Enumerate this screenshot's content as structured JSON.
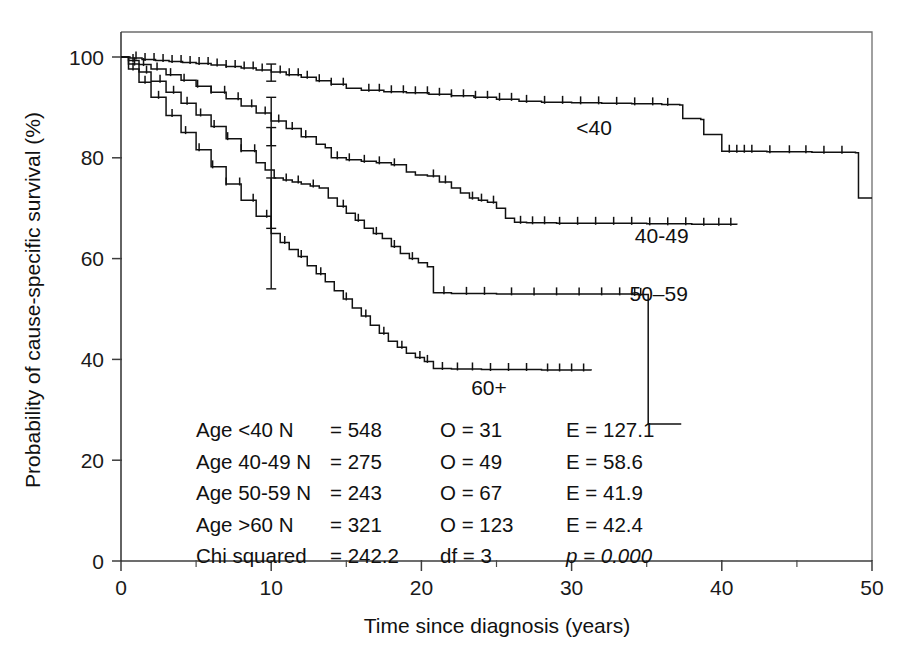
{
  "chart_data": {
    "type": "line",
    "title": "",
    "xlabel": "Time since diagnosis (years)",
    "ylabel": "Probability of cause-specific survival (%)",
    "xlim": [
      0,
      50
    ],
    "ylim": [
      0,
      100
    ],
    "xticks": [
      "0",
      "10",
      "20",
      "30",
      "40",
      "50"
    ],
    "xtick_values": [
      0,
      10,
      20,
      30,
      40,
      50
    ],
    "xminor_values": [
      5,
      15,
      25,
      35,
      45
    ],
    "yticks": [
      "0",
      "20",
      "40",
      "60",
      "80",
      "100"
    ],
    "ytick_values": [
      0,
      20,
      40,
      60,
      80,
      100
    ],
    "grid": false,
    "legend_position": "inline-curve-labels",
    "series": [
      {
        "name": "<40",
        "label": "<40",
        "label_x": 31.5,
        "label_y": 84.5,
        "points": [
          [
            0,
            100
          ],
          [
            0.6,
            99.8
          ],
          [
            1.4,
            99.5
          ],
          [
            2.3,
            99.3
          ],
          [
            3.2,
            99.1
          ],
          [
            4.1,
            98.9
          ],
          [
            5.0,
            98.7
          ],
          [
            6.0,
            98.4
          ],
          [
            7.0,
            98.1
          ],
          [
            8.0,
            97.8
          ],
          [
            9.0,
            97.4
          ],
          [
            10.0,
            97.0
          ],
          [
            11.0,
            96.5
          ],
          [
            12.0,
            96.0
          ],
          [
            13.0,
            95.3
          ],
          [
            14.0,
            94.6
          ],
          [
            15.0,
            93.8
          ],
          [
            16.0,
            93.4
          ],
          [
            17.5,
            93.1
          ],
          [
            19.0,
            92.9
          ],
          [
            20.5,
            92.6
          ],
          [
            22.0,
            92.3
          ],
          [
            23.5,
            92.0
          ],
          [
            25.0,
            91.6
          ],
          [
            26.5,
            91.2
          ],
          [
            28.0,
            91.0
          ],
          [
            30.0,
            90.9
          ],
          [
            32.0,
            90.8
          ],
          [
            34.0,
            90.7
          ],
          [
            36.0,
            90.6
          ],
          [
            37.2,
            90.5
          ],
          [
            37.4,
            87.8
          ],
          [
            38.6,
            87.6
          ],
          [
            38.8,
            84.6
          ],
          [
            40.0,
            81.3
          ],
          [
            43.0,
            81.2
          ],
          [
            46.0,
            81.1
          ],
          [
            48.9,
            81.0
          ],
          [
            49.1,
            72.0
          ],
          [
            50.0,
            72.0
          ]
        ],
        "censor_times": [
          1.0,
          1.6,
          2.2,
          2.8,
          3.4,
          4.0,
          4.6,
          5.2,
          5.8,
          6.4,
          7.0,
          7.6,
          8.2,
          8.8,
          9.4,
          10.6,
          11.2,
          11.8,
          12.4,
          13.2,
          14.0,
          14.8,
          16.5,
          17.2,
          18.0,
          18.8,
          19.6,
          20.4,
          21.2,
          22.0,
          22.8,
          23.6,
          24.4,
          25.2,
          26.0,
          27.0,
          28.2,
          29.4,
          30.6,
          31.8,
          33.0,
          34.2,
          35.4,
          36.4,
          40.5,
          41.0,
          41.5,
          42.0,
          43.2,
          44.5,
          45.6,
          46.8,
          48.0
        ],
        "ci_at_10": {
          "x": 10,
          "lower": 95.2,
          "upper": 98.6
        }
      },
      {
        "name": "40-49",
        "label": "40-49",
        "label_x": 36.0,
        "label_y": 63.0,
        "points": [
          [
            0,
            100
          ],
          [
            0.5,
            99.3
          ],
          [
            1.2,
            98.5
          ],
          [
            2.0,
            97.6
          ],
          [
            3.0,
            96.5
          ],
          [
            4.0,
            95.4
          ],
          [
            5.0,
            94.2
          ],
          [
            6.0,
            93.0
          ],
          [
            7.0,
            91.7
          ],
          [
            8.0,
            90.3
          ],
          [
            9.0,
            88.9
          ],
          [
            10.0,
            87.3
          ],
          [
            11.0,
            85.8
          ],
          [
            12.0,
            84.2
          ],
          [
            13.0,
            82.7
          ],
          [
            13.6,
            82.0
          ],
          [
            14.0,
            80.0
          ],
          [
            15.0,
            79.6
          ],
          [
            16.0,
            79.3
          ],
          [
            17.0,
            79.0
          ],
          [
            18.0,
            78.6
          ],
          [
            19.0,
            77.2
          ],
          [
            19.6,
            76.6
          ],
          [
            20.4,
            76.4
          ],
          [
            21.2,
            75.2
          ],
          [
            22.0,
            74.0
          ],
          [
            22.6,
            73.0
          ],
          [
            23.2,
            72.0
          ],
          [
            23.8,
            71.6
          ],
          [
            24.4,
            71.2
          ],
          [
            25.0,
            70.0
          ],
          [
            25.6,
            68.0
          ],
          [
            26.2,
            67.2
          ],
          [
            27.0,
            67.1
          ],
          [
            29.0,
            67.0
          ],
          [
            32.0,
            67.0
          ],
          [
            35.0,
            66.9
          ],
          [
            38.0,
            66.8
          ],
          [
            41.0,
            66.7
          ]
        ],
        "censor_times": [
          0.8,
          1.5,
          2.4,
          3.3,
          4.2,
          5.1,
          6.0,
          6.9,
          7.8,
          8.7,
          9.6,
          10.5,
          11.4,
          12.3,
          14.4,
          15.2,
          16.2,
          17.2,
          18.2,
          20.8,
          21.6,
          23.4,
          24.0,
          24.8,
          26.6,
          27.4,
          28.2,
          29.2,
          30.4,
          31.6,
          32.8,
          34.0,
          35.2,
          36.4,
          37.6,
          38.8,
          39.8,
          40.6
        ],
        "ci_at_10": {
          "x": 10,
          "lower": 82.4,
          "upper": 92.0
        }
      },
      {
        "name": "50-59",
        "label": "50–59",
        "label_x": 35.8,
        "label_y": 51.5,
        "points": [
          [
            0,
            100
          ],
          [
            0.5,
            98.6
          ],
          [
            1.2,
            97.0
          ],
          [
            2.0,
            95.2
          ],
          [
            3.0,
            93.0
          ],
          [
            4.0,
            90.8
          ],
          [
            5.0,
            88.5
          ],
          [
            6.0,
            86.2
          ],
          [
            7.0,
            83.8
          ],
          [
            8.0,
            81.4
          ],
          [
            9.0,
            79.0
          ],
          [
            9.6,
            77.6
          ],
          [
            10.2,
            76.0
          ],
          [
            10.8,
            75.6
          ],
          [
            11.4,
            75.2
          ],
          [
            12.0,
            74.8
          ],
          [
            12.6,
            74.4
          ],
          [
            13.2,
            74.0
          ],
          [
            13.8,
            72.0
          ],
          [
            14.4,
            70.4
          ],
          [
            15.0,
            69.0
          ],
          [
            15.6,
            67.6
          ],
          [
            16.2,
            66.0
          ],
          [
            16.8,
            65.0
          ],
          [
            17.4,
            64.0
          ],
          [
            18.0,
            62.4
          ],
          [
            18.6,
            61.0
          ],
          [
            19.2,
            60.0
          ],
          [
            19.8,
            59.2
          ],
          [
            20.4,
            58.4
          ],
          [
            20.8,
            53.2
          ],
          [
            22.0,
            53.1
          ],
          [
            25.0,
            53.0
          ],
          [
            28.0,
            53.0
          ],
          [
            31.0,
            53.0
          ],
          [
            34.0,
            52.9
          ],
          [
            34.9,
            52.9
          ],
          [
            35.1,
            27.2
          ],
          [
            36.0,
            27.2
          ],
          [
            37.3,
            27.2
          ]
        ],
        "censor_times": [
          0.9,
          1.7,
          2.6,
          3.5,
          4.4,
          5.3,
          6.2,
          7.1,
          8.0,
          8.9,
          11.0,
          11.8,
          12.8,
          14.8,
          15.8,
          17.0,
          18.2,
          19.4,
          21.5,
          23.0,
          24.2,
          26.0,
          27.5,
          29.0,
          30.5,
          32.0,
          33.2,
          34.2,
          34.6
        ],
        "ci_at_10": {
          "x": 10,
          "lower": 66.0,
          "upper": 86.0
        }
      },
      {
        "name": "60+",
        "label": "60+",
        "label_x": 24.5,
        "label_y": 33.0,
        "points": [
          [
            0,
            100
          ],
          [
            0.5,
            97.6
          ],
          [
            1.2,
            95.0
          ],
          [
            2.0,
            92.0
          ],
          [
            3.0,
            88.4
          ],
          [
            4.0,
            85.0
          ],
          [
            5.0,
            81.6
          ],
          [
            6.0,
            78.2
          ],
          [
            7.0,
            74.8
          ],
          [
            8.0,
            71.6
          ],
          [
            9.0,
            68.4
          ],
          [
            10.0,
            65.0
          ],
          [
            10.6,
            63.2
          ],
          [
            11.2,
            61.8
          ],
          [
            11.8,
            60.4
          ],
          [
            12.4,
            58.6
          ],
          [
            13.0,
            57.0
          ],
          [
            13.6,
            55.4
          ],
          [
            14.2,
            53.6
          ],
          [
            14.8,
            52.0
          ],
          [
            15.4,
            50.2
          ],
          [
            16.0,
            48.6
          ],
          [
            16.6,
            46.8
          ],
          [
            17.2,
            45.2
          ],
          [
            17.8,
            43.6
          ],
          [
            18.4,
            42.4
          ],
          [
            19.0,
            41.2
          ],
          [
            19.6,
            40.4
          ],
          [
            20.2,
            39.6
          ],
          [
            20.8,
            38.2
          ],
          [
            22.0,
            38.1
          ],
          [
            24.0,
            38.0
          ],
          [
            26.0,
            38.0
          ],
          [
            28.0,
            37.9
          ],
          [
            30.0,
            37.9
          ],
          [
            31.3,
            37.8
          ]
        ],
        "censor_times": [
          0.8,
          1.6,
          2.5,
          3.4,
          4.3,
          5.2,
          6.1,
          7.0,
          7.9,
          8.8,
          9.7,
          10.9,
          12.0,
          13.3,
          15.0,
          16.3,
          17.5,
          18.7,
          19.9,
          20.4,
          21.4,
          22.4,
          23.4,
          24.6,
          25.8,
          27.0,
          28.4,
          29.2,
          30.0,
          30.8
        ],
        "ci_at_10": {
          "x": 10,
          "lower": 54.0,
          "upper": 76.0
        }
      }
    ],
    "stats_table": {
      "rows": [
        {
          "group": "Age <40 N",
          "n": "= 548",
          "o": "O = 31",
          "e": "E = 127.1"
        },
        {
          "group": "Age 40-49 N",
          "n": "= 275",
          "o": "O = 49",
          "e": "E = 58.6"
        },
        {
          "group": "Age 50-59 N",
          "n": "= 243",
          "o": "O = 67",
          "e": "E = 41.9"
        },
        {
          "group": "Age >60 N",
          "n": "= 321",
          "o": "O = 123",
          "e": "E = 42.4"
        }
      ],
      "footer": {
        "label": "Chi squared",
        "value": "= 242.2",
        "df": "df = 3",
        "p": "p = 0.000"
      }
    }
  },
  "colors": {
    "curve": "#111111",
    "axis": "#3d3d3d",
    "frame": "#6e6e6e",
    "text": "#111111",
    "background": "#ffffff"
  }
}
